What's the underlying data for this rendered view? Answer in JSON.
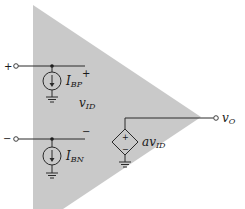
{
  "diagram": {
    "colors": {
      "triangle_fill": "#c9c9c9",
      "wire": "#2a2a2a",
      "background": "#ffffff"
    },
    "inputs": {
      "plus": {
        "terminal_label": "+",
        "polarity_mark": "+"
      },
      "minus": {
        "terminal_label": "−",
        "polarity_mark": "−"
      }
    },
    "labels": {
      "bias_current_p_main": "I",
      "bias_current_p_sub": "BP",
      "bias_current_n_main": "I",
      "bias_current_n_sub": "BN",
      "differential_voltage_main": "v",
      "differential_voltage_sub": "ID",
      "dependent_source_main": "av",
      "dependent_source_sub": "ID",
      "output_main": "v",
      "output_sub": "O"
    },
    "dependent_source": {
      "plus": "+",
      "minus": "−"
    }
  }
}
